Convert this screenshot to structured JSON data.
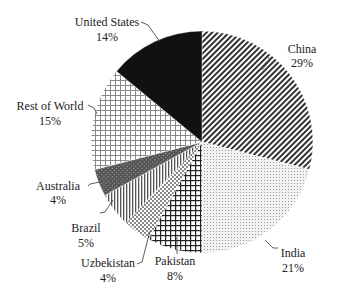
{
  "chart_data": {
    "type": "pie",
    "title": "",
    "start_angle_deg": 90,
    "direction": "clockwise",
    "slices": [
      {
        "label": "China",
        "value": 29,
        "pct_label": "29%",
        "pattern": "diag-dense"
      },
      {
        "label": "India",
        "value": 21,
        "pct_label": "21%",
        "pattern": "dots"
      },
      {
        "label": "Pakistan",
        "value": 8,
        "pct_label": "8%",
        "pattern": "grid-dark"
      },
      {
        "label": "Uzbekistan",
        "value": 4,
        "pct_label": "4%",
        "pattern": "checker"
      },
      {
        "label": "Brazil",
        "value": 5,
        "pct_label": "5%",
        "pattern": "vertical"
      },
      {
        "label": "Australia",
        "value": 4,
        "pct_label": "4%",
        "pattern": "dark-mesh"
      },
      {
        "label": "Rest of World",
        "value": 15,
        "pct_label": "15%",
        "pattern": "grid-light"
      },
      {
        "label": "United States",
        "value": 14,
        "pct_label": "14%",
        "pattern": "solid-black"
      }
    ]
  },
  "labels": {
    "china": {
      "name": "China",
      "pct": "29%"
    },
    "india": {
      "name": "India",
      "pct": "21%"
    },
    "pakistan": {
      "name": "Pakistan",
      "pct": "8%"
    },
    "uzbekistan": {
      "name": "Uzbekistan",
      "pct": "4%"
    },
    "brazil": {
      "name": "Brazil",
      "pct": "5%"
    },
    "australia": {
      "name": "Australia",
      "pct": "4%"
    },
    "rest": {
      "name": "Rest of World",
      "pct": "15%"
    },
    "us": {
      "name": "United States",
      "pct": "14%"
    }
  }
}
